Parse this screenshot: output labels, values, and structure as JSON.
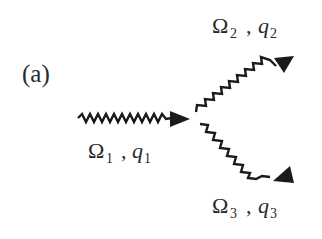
{
  "panel_label": "(a)",
  "incoming": {
    "omega": "Ω",
    "omega_sub": "1",
    "sep": ",",
    "q": "q",
    "q_sub": "1"
  },
  "outgoing_upper": {
    "omega": "Ω",
    "omega_sub": "2",
    "sep": ",",
    "q": "q",
    "q_sub": "2"
  },
  "outgoing_lower": {
    "omega": "Ω",
    "omega_sub": "3",
    "sep": ",",
    "q": "q",
    "q_sub": "3"
  },
  "colors": {
    "line": "#1a1a1a",
    "text": "#2a2a2a",
    "background": "#ffffff"
  }
}
